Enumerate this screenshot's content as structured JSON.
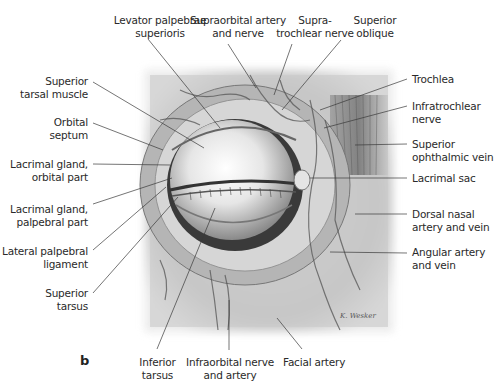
{
  "figure": {
    "panel_letter": "b",
    "labels": {
      "levator": "Levator palpebrae\nsuperioris",
      "supraorbital": "Supraorbital artery\nand nerve",
      "supratrochlear": "Supra-\ntrochlear nerve",
      "superior_oblique": "Superior\noblique",
      "superior_tarsal_muscle": "Superior\ntarsal muscle",
      "orbital_septum": "Orbital\nseptum",
      "lacrimal_orbital": "Lacrimal gland,\norbital part",
      "lacrimal_palpebral": "Lacrimal gland,\npalpebral part",
      "lateral_palpebral_ligament": "Lateral palpebral\nligament",
      "superior_tarsus": "Superior\ntarsus",
      "inferior_tarsus": "Inferior\ntarsus",
      "infraorbital": "Infraorbital nerve\nand artery",
      "facial_artery": "Facial artery",
      "trochlea": "Trochlea",
      "infratrochlear": "Infratrochlear\nnerve",
      "superior_ophthalmic_vein": "Superior\nophthalmic vein",
      "lacrimal_sac": "Lacrimal sac",
      "dorsal_nasal": "Dorsal nasal\nartery and vein",
      "angular": "Angular artery\nand vein"
    },
    "signature": "K. Wesker",
    "colors": {
      "text": "#2a2a2a",
      "leader": "#3a3a3a",
      "illustration_bg": "#d8d8d8",
      "eyeball": "#f2f2f2"
    }
  }
}
